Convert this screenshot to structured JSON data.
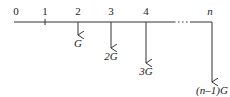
{
  "diagram": {
    "type": "cash-flow-gradient",
    "period_labels": [
      "0",
      "1",
      "2",
      "3",
      "4",
      "n"
    ],
    "ellipsis": "···",
    "flows": [
      {
        "period": "2",
        "label": "G",
        "multiple": 1
      },
      {
        "period": "3",
        "label": "2G",
        "multiple": 2
      },
      {
        "period": "4",
        "label": "3G",
        "multiple": 3
      },
      {
        "period": "n",
        "label": "(n–1)G",
        "multiple": 6
      }
    ]
  }
}
